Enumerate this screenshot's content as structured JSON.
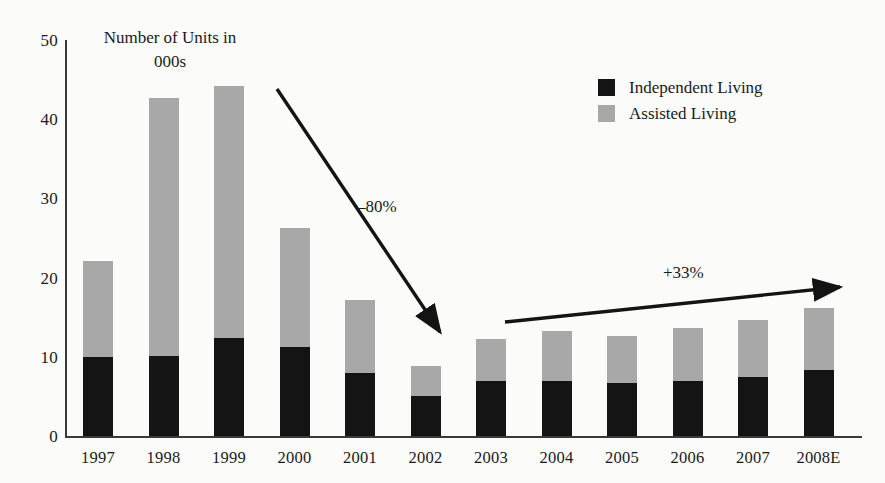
{
  "chart_data": {
    "type": "bar",
    "stacked": true,
    "title": "Number of Units in 000s",
    "title_lines": [
      "Number of Units in",
      "000s"
    ],
    "xlabel": "",
    "ylabel": "",
    "ylim": [
      0,
      50
    ],
    "yticks": [
      50,
      40,
      30,
      20,
      10,
      0
    ],
    "grid": false,
    "legend_position": "top-right",
    "categories": [
      "1997",
      "1998",
      "1999",
      "2000",
      "2001",
      "2002",
      "2003",
      "2004",
      "2005",
      "2006",
      "2007",
      "2008E"
    ],
    "series": [
      {
        "name": "Independent Living",
        "color": "#141414",
        "values": [
          10.0,
          10.1,
          12.4,
          11.2,
          7.9,
          5.0,
          6.9,
          7.0,
          6.7,
          7.0,
          7.4,
          8.3
        ]
      },
      {
        "name": "Assisted Living",
        "color": "#a8a8a8",
        "values": [
          12.1,
          32.6,
          31.8,
          15.1,
          9.3,
          3.8,
          5.4,
          6.3,
          5.9,
          6.6,
          7.2,
          7.9
        ]
      }
    ],
    "totals": [
      22.1,
      42.7,
      44.2,
      26.3,
      17.2,
      8.8,
      12.3,
      13.3,
      12.6,
      13.6,
      14.6,
      16.2
    ],
    "annotations": [
      {
        "name": "decline-arrow",
        "label": "–80%",
        "direction": "down-right",
        "from": {
          "x": 277,
          "y": 89
        },
        "to": {
          "x": 440,
          "y": 332
        }
      },
      {
        "name": "growth-arrow",
        "label": "+33%",
        "direction": "up-right",
        "from": {
          "x": 505,
          "y": 322
        },
        "to": {
          "x": 840,
          "y": 287
        }
      }
    ]
  },
  "legend": {
    "items": [
      {
        "label": "Independent Living",
        "color": "#141414"
      },
      {
        "label": "Assisted Living",
        "color": "#a8a8a8"
      }
    ]
  },
  "colors": {
    "independent_living": "#141414",
    "assisted_living": "#a8a8a8",
    "axis": "#3a3a3a",
    "text": "#1a1a1a",
    "background": "#fbfbfa"
  }
}
